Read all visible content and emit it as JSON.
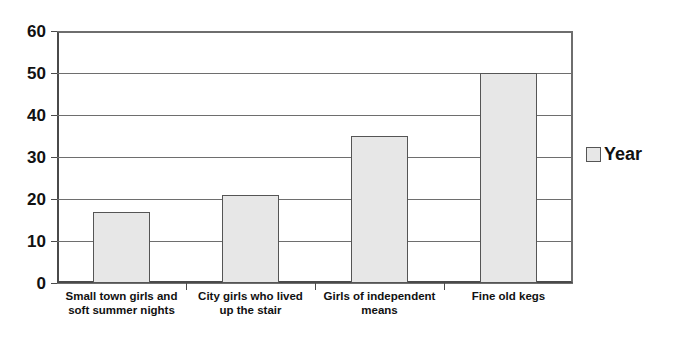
{
  "chart_data": {
    "type": "bar",
    "title": "",
    "subtitle": "",
    "xlabel": "",
    "ylabel": "",
    "categories": [
      "Small town girls and\nsoft summer nights",
      "City girls who lived\nup  the stair",
      "Girls of independent\nmeans",
      "Fine old kegs"
    ],
    "series": [
      {
        "name": "Year",
        "values": [
          17,
          21,
          35,
          50
        ]
      }
    ],
    "ylim": [
      0,
      60
    ],
    "ytick_labels": [
      "0",
      "10",
      "20",
      "30",
      "40",
      "50",
      "60"
    ],
    "ytick_values": [
      0,
      10,
      20,
      30,
      40,
      50,
      60
    ],
    "grid": true,
    "grid_axis": "y",
    "legend_position": "right",
    "legend_entries": [
      "Year"
    ],
    "colors": {
      "bar_fill": "#e7e7e7",
      "bar_border": "#555555",
      "gridline": "#6e6e6e",
      "axis": "#4a4a4a",
      "text": "#111111",
      "background": "#ffffff"
    }
  },
  "legend": {
    "series_label": "Year"
  }
}
